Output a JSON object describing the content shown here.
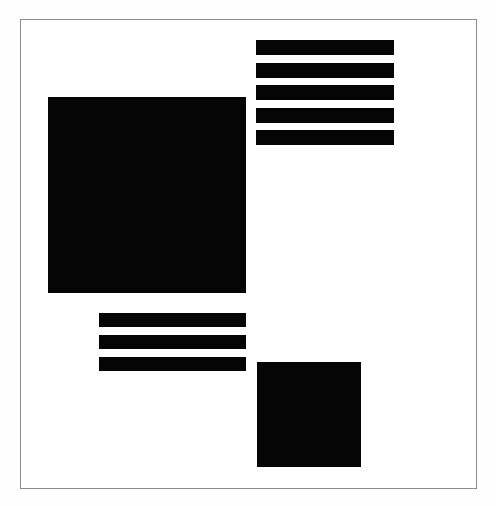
{
  "artwork": {
    "title": "Untitled Geometric Composition",
    "style": "abstract-geometric",
    "medium": "ink on paper",
    "canvas": {
      "width": 496,
      "height": 506,
      "background_color": "#fefefe",
      "paper_color": "#ffffff"
    },
    "frame": {
      "name": "border-frame",
      "x": 20,
      "y": 19,
      "width": 457,
      "height": 470,
      "stroke_color": "#8c8c8c",
      "stroke_width": 1,
      "fill_color": "#ffffff"
    },
    "ink_color": "#050505",
    "element_count": 11
  },
  "chart_data": {
    "type": "scatter",
    "subtitle": "",
    "xlabel": "",
    "ylabel": "",
    "xlim": [
      0,
      496
    ],
    "ylim": [
      0,
      506
    ],
    "grid": false,
    "legend": null,
    "shapes": [
      {
        "id": "large-square",
        "label": "Large Square",
        "kind": "square",
        "x": 48,
        "y": 97,
        "width": 198,
        "height": 196,
        "color": "#050505"
      },
      {
        "id": "small-square",
        "label": "Small Square",
        "kind": "square",
        "x": 257,
        "y": 362,
        "width": 104,
        "height": 105,
        "color": "#050505"
      }
    ],
    "bar_groups": [
      {
        "id": "upper-right-bars",
        "label": "Upper Right Bar Stack",
        "x": 256,
        "y": 40,
        "bar_width": 138,
        "bar_height": 15,
        "gap": 8,
        "count": 5,
        "color": "#050505",
        "bar_tops": [
          0,
          23,
          45,
          68,
          90
        ]
      },
      {
        "id": "lower-left-bars",
        "label": "Lower Left Bar Stack",
        "x": 99,
        "y": 313,
        "bar_width": 147,
        "bar_height": 14,
        "gap": 8,
        "count": 3,
        "color": "#050505",
        "bar_tops": [
          0,
          22,
          44
        ]
      }
    ]
  }
}
